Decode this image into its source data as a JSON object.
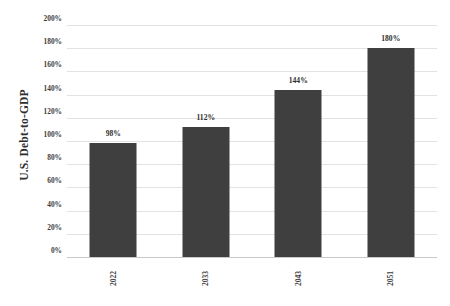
{
  "chart_data": {
    "type": "bar",
    "title": "",
    "subtitle": "",
    "xlabel": "",
    "ylabel": "U.S. Debt-to-GDP",
    "categories": [
      "2022",
      "2033",
      "2043",
      "2051"
    ],
    "values": [
      98,
      112,
      144,
      180
    ],
    "data_labels": [
      "98%",
      "112%",
      "144%",
      "180%"
    ],
    "ylim": [
      0,
      200
    ],
    "ytick_values": [
      200,
      180,
      160,
      140,
      120,
      100,
      80,
      60,
      40,
      20,
      0
    ],
    "ytick_labels": [
      "200%",
      "180%",
      "160%",
      "140%",
      "120%",
      "100%",
      "80%",
      "60%",
      "40%",
      "20%",
      "0%"
    ],
    "grid": true,
    "grid_axis": "y",
    "legend": false,
    "legend_position": "none",
    "series": [
      {
        "name": "U.S. Debt-to-GDP",
        "values": [
          98,
          112,
          144,
          180
        ],
        "color": "#3F3F3F"
      }
    ],
    "colors": {
      "bar": "#3F3F3F",
      "gridline": "#E2E2E2",
      "baseline": "#C9C9C9",
      "text": "#3C3C3C",
      "background": "#FFFFFF"
    }
  }
}
